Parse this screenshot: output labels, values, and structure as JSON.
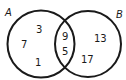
{
  "diagram": {
    "type": "venn",
    "sets": [
      {
        "label": "A",
        "only_values": [
          "3",
          "7",
          "1"
        ]
      },
      {
        "label": "B",
        "only_values": [
          "13",
          "17"
        ]
      }
    ],
    "intersection_values": [
      "9",
      "5"
    ],
    "stroke_color": "#1a1a1a",
    "background": "#ffffff"
  }
}
